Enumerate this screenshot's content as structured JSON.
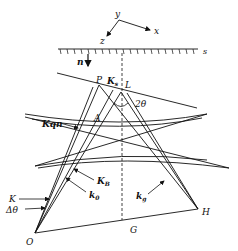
{
  "diagram": {
    "type": "reciprocal-space geometry (Kikuchi/diffraction construction)",
    "axes": {
      "x_label": "x",
      "y_label": "y",
      "z_label": "z"
    },
    "surface": {
      "label": "s",
      "normal_label": "n"
    },
    "points": {
      "P": "P",
      "L": "L",
      "A": "A",
      "O": "O",
      "H": "H",
      "G": "G"
    },
    "vectors": {
      "Ks": "K",
      "Ks_sub": "s",
      "Kqn": "Kqn",
      "KB": "K",
      "KB_sub": "B",
      "k0": "k",
      "k0_sub": "0",
      "kg": "k",
      "kg_sub": "g",
      "K": "K",
      "delta_theta": "Δθ"
    },
    "angle_label": "2θ",
    "colors": {
      "line": "#111111",
      "background": "#ffffff"
    }
  }
}
